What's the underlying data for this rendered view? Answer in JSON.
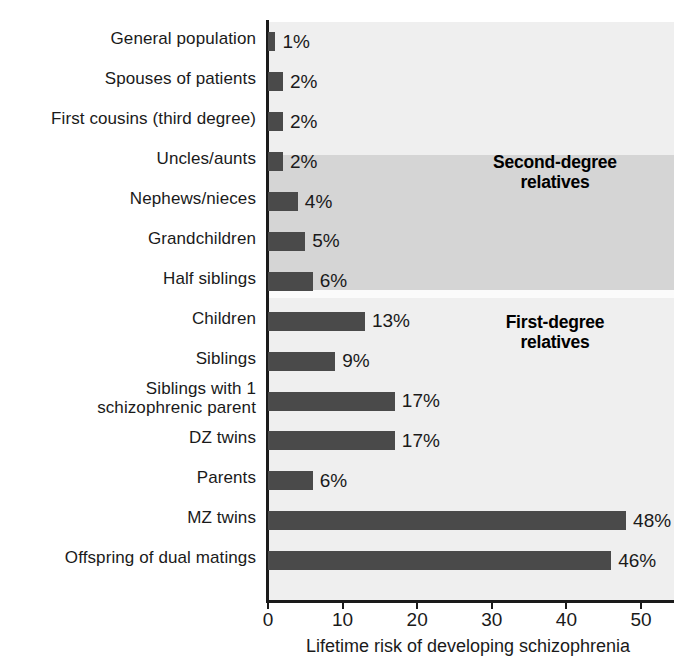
{
  "chart_data": {
    "type": "bar",
    "orientation": "horizontal",
    "title": "",
    "xlabel": "Lifetime risk of developing schizophrenia",
    "ylabel": "",
    "xlim": [
      0,
      54.5
    ],
    "xticks": [
      0,
      10,
      20,
      30,
      40,
      50
    ],
    "xtick_labels": [
      "0",
      "10",
      "20",
      "30",
      "40",
      "50"
    ],
    "grid": false,
    "legend": "none",
    "bar_color": "#4a4a4a",
    "plot_background": "#efefef",
    "band_background": "#d5d5d5",
    "categories": [
      "General population",
      "Spouses of patients",
      "First cousins (third degree)",
      "Uncles/aunts",
      "Nephews/nieces",
      "Grandchildren",
      "Half siblings",
      "Children",
      "Siblings",
      "Siblings with 1\nschizophrenic parent",
      "DZ twins",
      "Parents",
      "MZ twins",
      "Offspring of dual matings"
    ],
    "values": [
      1,
      2,
      2,
      2,
      4,
      5,
      6,
      13,
      9,
      17,
      17,
      6,
      48,
      46
    ],
    "value_labels": [
      "1%",
      "2%",
      "2%",
      "2%",
      "4%",
      "5%",
      "6%",
      "13%",
      "9%",
      "17%",
      "17%",
      "6%",
      "48%",
      "46%"
    ],
    "annotations": [
      {
        "text": "Second-degree\nrelatives",
        "group_start_index": 3,
        "group_end_index": 6
      },
      {
        "text": "First-degree\nrelatives",
        "group_start_index": 7,
        "group_end_index": 13
      }
    ]
  }
}
